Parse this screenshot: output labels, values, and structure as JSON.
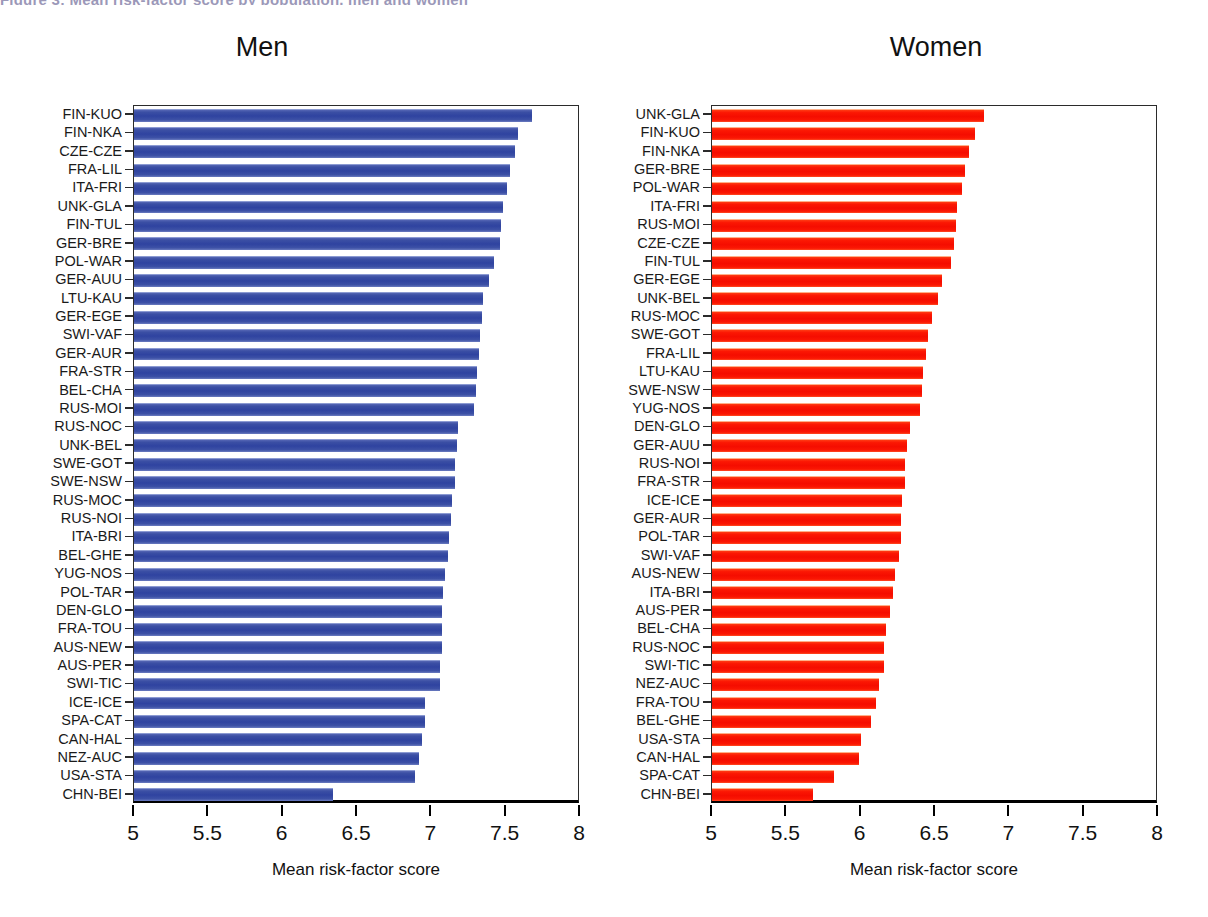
{
  "figure": {
    "clipped_top_title": "Figure 3: Mean risk-factor score by population, men and women",
    "axis_title": "Mean risk-factor score",
    "xticks": [
      5,
      5.5,
      6,
      6.5,
      7,
      7.5,
      8
    ],
    "xtick_labels": [
      "5",
      "5.5",
      "6",
      "6.5",
      "7",
      "7.5",
      "8"
    ],
    "colors": {
      "men_bar": "#2f43a0",
      "women_bar": "#f50d00",
      "axis": "#000000",
      "text": "#1a1a1a"
    }
  },
  "chart_data": [
    {
      "type": "bar",
      "orientation": "horizontal",
      "title": "Men",
      "xlabel": "Mean risk-factor score",
      "ylabel": "",
      "xlim": [
        5,
        8
      ],
      "grid": false,
      "legend": null,
      "bar_color": "#2f43a0",
      "categories": [
        "FIN-KUO",
        "FIN-NKA",
        "CZE-CZE",
        "FRA-LIL",
        "ITA-FRI",
        "UNK-GLA",
        "FIN-TUL",
        "GER-BRE",
        "POL-WAR",
        "GER-AUU",
        "LTU-KAU",
        "GER-EGE",
        "SWI-VAF",
        "GER-AUR",
        "FRA-STR",
        "BEL-CHA",
        "RUS-MOI",
        "RUS-NOC",
        "UNK-BEL",
        "SWE-GOT",
        "SWE-NSW",
        "RUS-MOC",
        "RUS-NOI",
        "ITA-BRI",
        "BEL-GHE",
        "YUG-NOS",
        "POL-TAR",
        "DEN-GLO",
        "FRA-TOU",
        "AUS-NEW",
        "AUS-PER",
        "SWI-TIC",
        "ICE-ICE",
        "SPA-CAT",
        "CAN-HAL",
        "NEZ-AUC",
        "USA-STA",
        "CHN-BEI"
      ],
      "values": [
        7.68,
        7.58,
        7.56,
        7.53,
        7.51,
        7.48,
        7.47,
        7.46,
        7.42,
        7.39,
        7.35,
        7.34,
        7.33,
        7.32,
        7.31,
        7.3,
        7.29,
        7.18,
        7.17,
        7.16,
        7.16,
        7.14,
        7.13,
        7.12,
        7.11,
        7.09,
        7.08,
        7.07,
        7.07,
        7.07,
        7.06,
        7.06,
        6.96,
        6.96,
        6.94,
        6.92,
        6.89,
        6.34
      ]
    },
    {
      "type": "bar",
      "orientation": "horizontal",
      "title": "Women",
      "xlabel": "Mean risk-factor score",
      "ylabel": "",
      "xlim": [
        5,
        8
      ],
      "grid": false,
      "legend": null,
      "bar_color": "#f50d00",
      "categories": [
        "UNK-GLA",
        "FIN-KUO",
        "FIN-NKA",
        "GER-BRE",
        "POL-WAR",
        "ITA-FRI",
        "RUS-MOI",
        "CZE-CZE",
        "FIN-TUL",
        "GER-EGE",
        "UNK-BEL",
        "RUS-MOC",
        "SWE-GOT",
        "FRA-LIL",
        "LTU-KAU",
        "SWE-NSW",
        "YUG-NOS",
        "DEN-GLO",
        "GER-AUU",
        "RUS-NOI",
        "FRA-STR",
        "ICE-ICE",
        "GER-AUR",
        "POL-TAR",
        "SWI-VAF",
        "AUS-NEW",
        "ITA-BRI",
        "AUS-PER",
        "BEL-CHA",
        "RUS-NOC",
        "SWI-TIC",
        "NEZ-AUC",
        "FRA-TOU",
        "BEL-GHE",
        "USA-STA",
        "CAN-HAL",
        "SPA-CAT",
        "CHN-BEI"
      ],
      "values": [
        6.83,
        6.77,
        6.73,
        6.7,
        6.68,
        6.65,
        6.64,
        6.63,
        6.61,
        6.55,
        6.52,
        6.48,
        6.45,
        6.44,
        6.42,
        6.41,
        6.4,
        6.33,
        6.31,
        6.3,
        6.3,
        6.28,
        6.27,
        6.27,
        6.26,
        6.23,
        6.22,
        6.2,
        6.17,
        6.16,
        6.16,
        6.12,
        6.1,
        6.07,
        6.0,
        5.99,
        5.82,
        5.68
      ]
    }
  ]
}
